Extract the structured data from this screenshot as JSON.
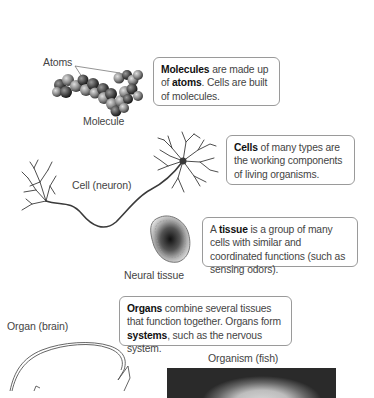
{
  "figure": {
    "levels": [
      {
        "id": "molecule",
        "image_label": "Molecule",
        "pointer_label": "Atoms",
        "description": {
          "bold1": "Molecules",
          "text1": " are made up of ",
          "bold2": "atoms",
          "text2": ". Cells are built of molecules."
        }
      },
      {
        "id": "cell",
        "image_label": "Cell (neuron)",
        "description": {
          "bold1": "Cells",
          "text1": " of many types are the working components of living organisms."
        }
      },
      {
        "id": "tissue",
        "image_label": "Neural tissue",
        "description": {
          "text0": "A ",
          "bold1": "tissue",
          "text1": " is a group of many cells with similar and coordinated functions (such as sensing odors)."
        }
      },
      {
        "id": "organ",
        "image_label": "Organ (brain)",
        "description": {
          "bold1": "Organs",
          "text1": " combine several tissues that function together. Organs form ",
          "bold2": "systems",
          "text2": ", such as the nervous system."
        }
      },
      {
        "id": "organism",
        "image_label": "Organism (fish)"
      }
    ]
  }
}
